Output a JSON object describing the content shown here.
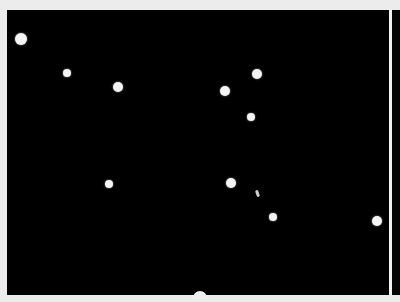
{
  "image": {
    "description": "Black field with scattered bright circular particles",
    "background_color": "#000000",
    "border_color": "#ececec",
    "particle_color": "#f4f4f4",
    "particles": [
      {
        "x": 21,
        "y": 39,
        "r": 6
      },
      {
        "x": 67,
        "y": 73,
        "r": 4
      },
      {
        "x": 118,
        "y": 87,
        "r": 5
      },
      {
        "x": 225,
        "y": 91,
        "r": 5
      },
      {
        "x": 257,
        "y": 74,
        "r": 5
      },
      {
        "x": 251,
        "y": 117,
        "r": 4
      },
      {
        "x": 109,
        "y": 184,
        "r": 4
      },
      {
        "x": 231,
        "y": 183,
        "r": 5
      },
      {
        "x": 273,
        "y": 217,
        "r": 4
      },
      {
        "x": 377,
        "y": 221,
        "r": 5
      }
    ]
  }
}
